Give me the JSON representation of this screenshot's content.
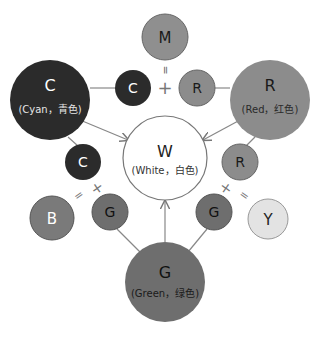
{
  "diagram": {
    "nodes": {
      "magenta": {
        "letter": "M",
        "fill": "#8f8f8f",
        "text_color": "#1a1a1a"
      },
      "cyan_big": {
        "letter": "C",
        "sub": "(Cyan，青色)",
        "fill": "#2b2b2b",
        "text_color": "#ffffff"
      },
      "red_big": {
        "letter": "R",
        "sub": "(Red，红色)",
        "fill": "#8c8c8c",
        "text_color": "#1a1a1a"
      },
      "white": {
        "letter": "W",
        "sub": "(White，白色)",
        "fill": "#ffffff",
        "text_color": "#222222"
      },
      "green_big": {
        "letter": "G",
        "sub": "(Green，绿色)",
        "fill": "#6e6e6e",
        "text_color": "#111111"
      },
      "cyan_small_top": {
        "letter": "C",
        "fill": "#2b2b2b",
        "text_color": "#ffffff"
      },
      "red_small_top": {
        "letter": "R",
        "fill": "#8c8c8c",
        "text_color": "#1a1a1a"
      },
      "cyan_small_low": {
        "letter": "C",
        "fill": "#2b2b2b",
        "text_color": "#ffffff"
      },
      "red_small_low": {
        "letter": "R",
        "fill": "#8c8c8c",
        "text_color": "#1a1a1a"
      },
      "blue": {
        "letter": "B",
        "fill": "#7a7a7a",
        "text_color": "#ffffff"
      },
      "green_small_left": {
        "letter": "G",
        "fill": "#6e6e6e",
        "text_color": "#111111"
      },
      "green_small_right": {
        "letter": "G",
        "fill": "#6e6e6e",
        "text_color": "#111111"
      },
      "yellow": {
        "letter": "Y",
        "fill": "#e3e3e3",
        "text_color": "#222222"
      }
    },
    "operators": {
      "top_plus": "+",
      "top_equals": "=",
      "left_plus": "+",
      "left_equals": "=",
      "right_plus": "+",
      "right_equals": "="
    },
    "colors": {
      "line": "#777777",
      "circle_stroke": "#666666"
    }
  }
}
